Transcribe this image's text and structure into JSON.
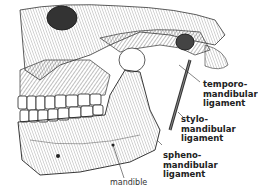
{
  "figure": {
    "labels": [
      {
        "id": "temporomandibular",
        "lines": [
          "temporo-",
          "mandibular",
          "ligament"
        ]
      },
      {
        "id": "stylomandibular",
        "lines": [
          "stylo-",
          "mandibular",
          "ligament"
        ]
      },
      {
        "id": "sphenomandibular",
        "lines": [
          "spheno-",
          "mandibular",
          "ligament"
        ]
      },
      {
        "id": "mandible",
        "lines": [
          "mandible"
        ]
      }
    ]
  },
  "colors": {
    "ink": "#222222",
    "background": "#ffffff",
    "shade": "#555555"
  }
}
